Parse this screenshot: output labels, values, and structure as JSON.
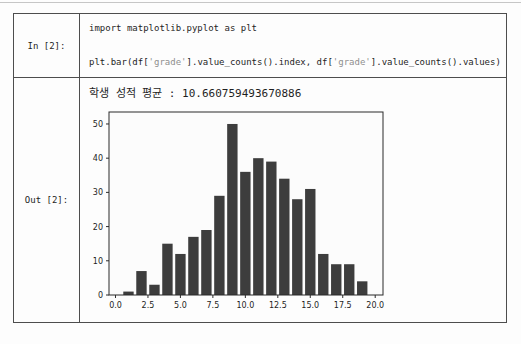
{
  "colors": {
    "code_text": "#1f1f1f",
    "code_string": "#8f8f8f",
    "table_border": "#4d4d4d",
    "top_rule": "#c6c6c6",
    "axis": "#2b2b2b",
    "tick_label": "#1d1d1d",
    "bar": "#3d3d3d",
    "figure_bg": "#fcfcfc"
  },
  "cells": {
    "input": {
      "label": "In [2]:",
      "code": {
        "line1": {
          "seg1": "import matplotlib.pyplot as plt"
        },
        "line2": {
          "seg1": "plt.bar(df[",
          "seg2": "'grade'",
          "seg3": "].value_counts().index, df[",
          "seg4": "'grade'",
          "seg5": "].value_counts().values)"
        }
      }
    },
    "output": {
      "label": "Out [2]:",
      "text": "학생 성적 평균 : 10.660759493670886"
    }
  },
  "chart_data": {
    "type": "bar",
    "title": "",
    "xlabel": "",
    "ylabel": "",
    "x": [
      1,
      2,
      3,
      4,
      5,
      6,
      7,
      8,
      9,
      10,
      11,
      12,
      13,
      14,
      15,
      16,
      17,
      18,
      19
    ],
    "values": [
      1,
      7,
      3,
      15,
      12,
      17,
      19,
      29,
      50,
      36,
      40,
      39,
      34,
      28,
      31,
      12,
      9,
      9,
      4
    ],
    "bar_width": 0.8,
    "bar_color": "#3d3d3d",
    "xlim": [
      -0.5,
      20.6
    ],
    "ylim": [
      0,
      53.5
    ],
    "xticks": [
      0,
      2.5,
      5,
      7.5,
      10,
      12.5,
      15,
      17.5,
      20
    ],
    "xtick_labels": [
      "0.0",
      "2.5",
      "5.0",
      "7.5",
      "10.0",
      "12.5",
      "15.0",
      "17.5",
      "20.0"
    ],
    "yticks": [
      0,
      10,
      20,
      30,
      40,
      50
    ],
    "ytick_labels": [
      "0",
      "10",
      "20",
      "30",
      "40",
      "50"
    ],
    "grid": false,
    "legend": null
  }
}
